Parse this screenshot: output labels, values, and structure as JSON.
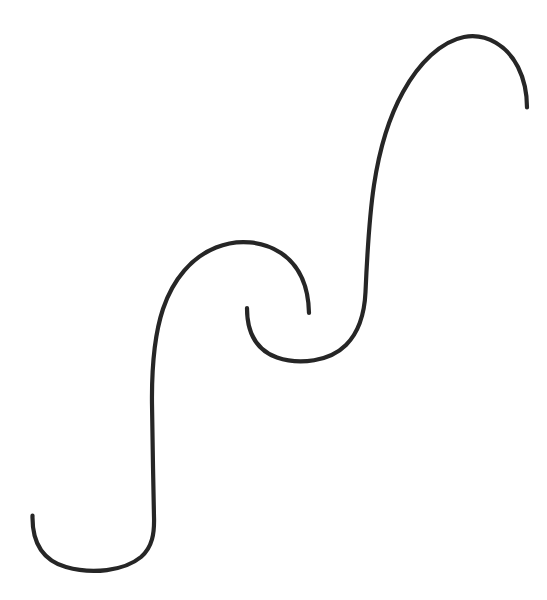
{
  "canvas": {
    "width": 547,
    "height": 600,
    "background_color": "#ffffff",
    "title": "Double spiral ogee curve"
  },
  "drawing": {
    "name": "double-spiral-curve",
    "description": "A single continuous hand-drawn line forming a large S / ogee shape: an open hook at lower left, rising to a spiral roll in the middle, then rising again to an inverted hook at upper right.",
    "stroke_color": "#262626",
    "stroke_width": 4.2,
    "stroke_linecap": "round",
    "fill": "none",
    "path": "M 32.5 515.5 C 32.0 541.0 42.0 560.0 66.0 567.0 C 92.0 574.5 124.0 571.0 141.0 557.0 C 152.5 547.0 154.5 533.0 154.0 517.0 C 153.2 480.0 152.5 440.0 152.0 404.0 C 151.6 368.0 154.0 336.0 163.0 309.0 C 173.0 279.0 192.0 257.0 216.0 247.5 C 238.0 238.5 263.0 241.0 281.0 253.0 C 299.5 265.5 308.5 287.0 309.0 313.0",
    "path_segment_2": "M 247.0 308.0 C 247.0 333.0 256.0 350.0 277.0 357.5 C 300.0 365.5 330.0 361.0 346.0 345.0 C 359.0 332.0 364.5 314.0 365.5 292.0 C 367.0 258.0 369.0 218.0 374.0 185.0 C 379.0 152.0 388.0 119.0 403.0 92.0 C 419.0 63.0 441.0 41.5 464.0 37.0 C 487.0 32.5 508.0 47.0 518.0 67.0 C 525.0 81.0 527.0 94.0 527.0 107.5",
    "endpoints": [
      {
        "name": "lower-left-tip",
        "x": 32.5,
        "y": 515.5
      },
      {
        "name": "inner-spiral-tip-right",
        "x": 309.0,
        "y": 313.0
      },
      {
        "name": "inner-spiral-tip-left",
        "x": 247.0,
        "y": 308.0
      },
      {
        "name": "upper-right-tip",
        "x": 527.0,
        "y": 107.5
      }
    ],
    "extrema": [
      {
        "name": "bottom-hook-low-point",
        "x": 95.0,
        "y": 568.0
      },
      {
        "name": "first-arch-apex",
        "x": 245.0,
        "y": 243.0
      },
      {
        "name": "middle-loop-low-point",
        "x": 300.0,
        "y": 358.0
      },
      {
        "name": "top-arch-apex",
        "x": 470.0,
        "y": 37.0
      }
    ]
  }
}
